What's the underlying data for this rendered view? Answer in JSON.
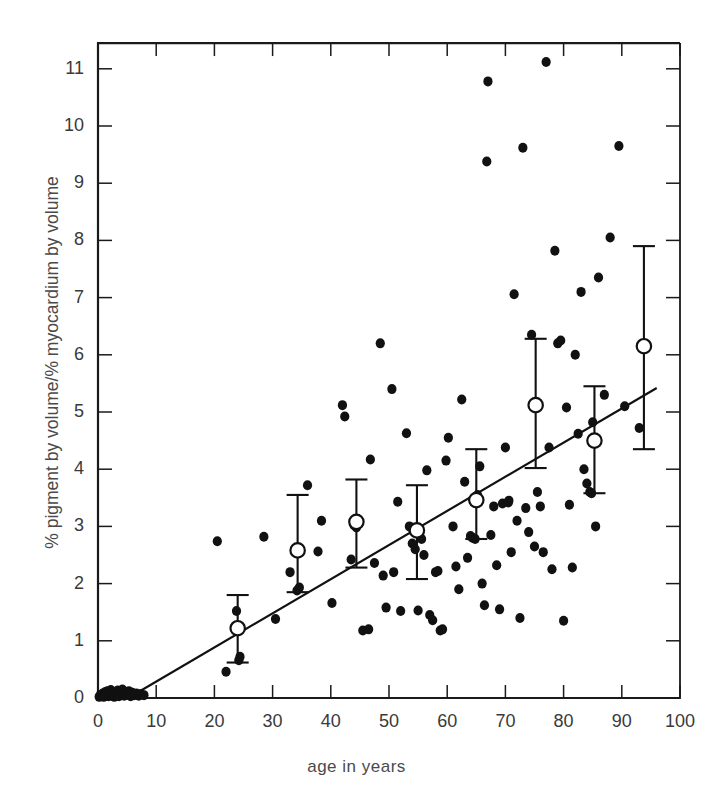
{
  "figure": {
    "title": "",
    "caption_visible": false
  },
  "chart_data": {
    "type": "scatter",
    "title": "",
    "xlabel": "age in years",
    "ylabel": "% pigment by volume/% myocardium by volume",
    "xlim": [
      0,
      100
    ],
    "ylim": [
      0,
      11.45
    ],
    "xticks": [
      0,
      10,
      20,
      30,
      40,
      50,
      60,
      70,
      80,
      90,
      100
    ],
    "xtick_labels": [
      "0",
      "10",
      "20",
      "30",
      "40",
      "50",
      "60",
      "70",
      "80",
      "90",
      "100"
    ],
    "yticks": [
      0,
      1,
      2,
      3,
      4,
      5,
      6,
      7,
      8,
      9,
      10,
      11
    ],
    "ytick_labels": [
      "0",
      "1",
      "2",
      "3",
      "4",
      "5",
      "6",
      "7",
      "8",
      "9",
      "10",
      "11"
    ],
    "grid": false,
    "legend": null,
    "legend_position": "none",
    "marker_color": "#111111",
    "mean_marker_facecolor": "#ffffff",
    "mean_marker_edgecolor": "#111111",
    "line_color": "#111111",
    "axis_color": "#1a1a1a",
    "series": [
      {
        "name": "individual hearts",
        "marker": "filled-circle",
        "points": [
          [
            0.2,
            0.02
          ],
          [
            0.4,
            0.05
          ],
          [
            0.6,
            0.03
          ],
          [
            0.8,
            0.08
          ],
          [
            1.0,
            0.02
          ],
          [
            1.2,
            0.1
          ],
          [
            1.4,
            0.05
          ],
          [
            1.6,
            0.12
          ],
          [
            1.8,
            0.03
          ],
          [
            2.0,
            0.07
          ],
          [
            2.2,
            0.14
          ],
          [
            2.4,
            0.04
          ],
          [
            2.6,
            0.09
          ],
          [
            2.8,
            0.02
          ],
          [
            3.0,
            0.11
          ],
          [
            3.2,
            0.06
          ],
          [
            3.4,
            0.13
          ],
          [
            3.6,
            0.03
          ],
          [
            3.8,
            0.08
          ],
          [
            4.0,
            0.05
          ],
          [
            4.2,
            0.15
          ],
          [
            4.5,
            0.04
          ],
          [
            4.8,
            0.1
          ],
          [
            5.0,
            0.06
          ],
          [
            5.3,
            0.12
          ],
          [
            5.6,
            0.03
          ],
          [
            5.9,
            0.09
          ],
          [
            6.2,
            0.05
          ],
          [
            6.6,
            0.08
          ],
          [
            7.0,
            0.04
          ],
          [
            7.4,
            0.07
          ],
          [
            7.9,
            0.05
          ],
          [
            20.5,
            2.74
          ],
          [
            22.0,
            0.46
          ],
          [
            23.8,
            1.52
          ],
          [
            24.2,
            0.66
          ],
          [
            24.4,
            0.72
          ],
          [
            28.5,
            2.82
          ],
          [
            30.5,
            1.38
          ],
          [
            33.0,
            2.2
          ],
          [
            34.2,
            1.88
          ],
          [
            34.6,
            1.93
          ],
          [
            36.0,
            3.72
          ],
          [
            37.8,
            2.56
          ],
          [
            38.4,
            3.1
          ],
          [
            40.2,
            1.66
          ],
          [
            42.0,
            5.12
          ],
          [
            42.4,
            4.92
          ],
          [
            43.5,
            2.42
          ],
          [
            44.0,
            3.02
          ],
          [
            44.4,
            2.98
          ],
          [
            45.5,
            1.18
          ],
          [
            46.5,
            1.2
          ],
          [
            46.8,
            4.17
          ],
          [
            47.5,
            2.36
          ],
          [
            48.5,
            6.2
          ],
          [
            49.0,
            2.14
          ],
          [
            49.5,
            1.58
          ],
          [
            50.5,
            5.4
          ],
          [
            50.8,
            2.2
          ],
          [
            51.5,
            3.43
          ],
          [
            52.0,
            1.52
          ],
          [
            53.0,
            4.63
          ],
          [
            53.5,
            3.0
          ],
          [
            53.8,
            2.98
          ],
          [
            54.0,
            2.7
          ],
          [
            54.5,
            2.6
          ],
          [
            55.0,
            1.53
          ],
          [
            55.6,
            2.78
          ],
          [
            56.0,
            2.5
          ],
          [
            56.5,
            3.98
          ],
          [
            57.0,
            1.45
          ],
          [
            57.5,
            1.36
          ],
          [
            58.0,
            2.2
          ],
          [
            58.4,
            2.22
          ],
          [
            58.8,
            1.18
          ],
          [
            59.2,
            1.2
          ],
          [
            59.8,
            4.15
          ],
          [
            60.2,
            4.55
          ],
          [
            61.0,
            3.0
          ],
          [
            61.5,
            2.3
          ],
          [
            62.0,
            1.9
          ],
          [
            62.5,
            5.22
          ],
          [
            63.0,
            3.78
          ],
          [
            63.5,
            2.45
          ],
          [
            64.0,
            2.83
          ],
          [
            64.4,
            2.8
          ],
          [
            64.8,
            2.78
          ],
          [
            65.2,
            3.55
          ],
          [
            65.6,
            4.05
          ],
          [
            66.0,
            2.0
          ],
          [
            66.4,
            1.62
          ],
          [
            66.8,
            9.38
          ],
          [
            67.0,
            10.78
          ],
          [
            67.5,
            2.85
          ],
          [
            68.0,
            3.35
          ],
          [
            68.5,
            2.32
          ],
          [
            69.0,
            1.55
          ],
          [
            69.5,
            3.4
          ],
          [
            70.0,
            4.38
          ],
          [
            70.5,
            3.42
          ],
          [
            70.6,
            3.45
          ],
          [
            71.0,
            2.55
          ],
          [
            71.5,
            7.06
          ],
          [
            72.0,
            3.1
          ],
          [
            72.5,
            1.4
          ],
          [
            73.0,
            9.62
          ],
          [
            73.5,
            3.32
          ],
          [
            74.0,
            2.9
          ],
          [
            74.5,
            6.35
          ],
          [
            75.0,
            2.65
          ],
          [
            75.5,
            3.6
          ],
          [
            76.0,
            3.35
          ],
          [
            76.5,
            2.55
          ],
          [
            77.0,
            11.12
          ],
          [
            77.5,
            4.38
          ],
          [
            78.0,
            2.25
          ],
          [
            78.5,
            7.82
          ],
          [
            79.0,
            6.2
          ],
          [
            79.5,
            6.25
          ],
          [
            80.0,
            1.35
          ],
          [
            80.5,
            5.08
          ],
          [
            81.0,
            3.38
          ],
          [
            81.5,
            2.28
          ],
          [
            82.0,
            6.0
          ],
          [
            82.5,
            4.62
          ],
          [
            83.0,
            7.1
          ],
          [
            83.5,
            4.0
          ],
          [
            84.0,
            3.75
          ],
          [
            84.5,
            3.6
          ],
          [
            84.8,
            3.58
          ],
          [
            85.0,
            4.82
          ],
          [
            85.5,
            3.0
          ],
          [
            86.0,
            7.35
          ],
          [
            87.0,
            5.3
          ],
          [
            88.0,
            8.05
          ],
          [
            89.5,
            9.65
          ],
          [
            90.5,
            5.1
          ],
          [
            93.0,
            4.72
          ]
        ]
      },
      {
        "name": "decade means with SD",
        "marker": "open-circle-errorbar",
        "points": [
          {
            "x": 24.0,
            "y": 1.22,
            "lo": 0.62,
            "hi": 1.8
          },
          {
            "x": 34.3,
            "y": 2.58,
            "lo": 1.85,
            "hi": 3.55
          },
          {
            "x": 44.4,
            "y": 3.08,
            "lo": 2.28,
            "hi": 3.82
          },
          {
            "x": 54.8,
            "y": 2.93,
            "lo": 2.08,
            "hi": 3.72
          },
          {
            "x": 65.0,
            "y": 3.46,
            "lo": 2.78,
            "hi": 4.35
          },
          {
            "x": 75.2,
            "y": 5.12,
            "lo": 4.02,
            "hi": 6.28
          },
          {
            "x": 85.3,
            "y": 4.5,
            "lo": 3.58,
            "hi": 5.45
          },
          {
            "x": 93.8,
            "y": 6.15,
            "lo": 4.35,
            "hi": 7.9
          }
        ]
      }
    ],
    "regression_line": {
      "style": "solid",
      "x_start": 5.2,
      "y_start": 0.0,
      "x_end": 96.0,
      "y_end": 5.42
    }
  }
}
